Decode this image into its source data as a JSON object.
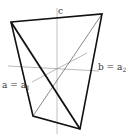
{
  "diagram": {
    "background": "#ffffff",
    "stroke_color": "#111111",
    "thin_color": "#777777",
    "labels": {
      "c": "c",
      "a_main": "a = a",
      "a_sub": "1",
      "b_main": "b = a",
      "b_sub": "2"
    },
    "vertices": {
      "top_left": [
        11,
        22
      ],
      "top_right": [
        102,
        14
      ],
      "bottom_right": [
        80,
        129
      ],
      "bottom_left": [
        33,
        116
      ]
    },
    "axes": {
      "c": {
        "x1": 57,
        "y1": 8,
        "x2": 57,
        "y2": 134
      },
      "b": {
        "x1": 8,
        "y1": 66,
        "x2": 99,
        "y2": 71
      },
      "a": {
        "x1": 32,
        "y1": 82,
        "x2": 87,
        "y2": 53
      }
    }
  }
}
